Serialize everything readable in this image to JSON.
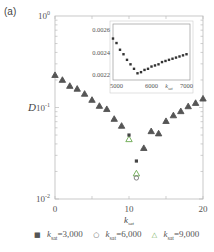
{
  "panel_label": "(a)",
  "chart_data": [
    {
      "type": "scatter",
      "title": "",
      "xlabel": "k_sat",
      "ylabel": "D",
      "xscale": "linear",
      "yscale": "log",
      "xlim": [
        0,
        20
      ],
      "ylim": [
        0.01,
        1
      ],
      "xticks": [
        0,
        10,
        20
      ],
      "xtick_labels": [
        "0",
        "10",
        "20"
      ],
      "yticks": [
        0.01,
        0.1,
        1
      ],
      "ytick_labels": [
        "10^-2",
        "10^-1",
        "10^0"
      ],
      "grid": false,
      "legend_position": "bottom",
      "series": [
        {
          "name": "k_sat=3,000",
          "marker": "square",
          "color": "#555555",
          "x": [
            0,
            1,
            2,
            3,
            4,
            5,
            6,
            7,
            8,
            9,
            10,
            11,
            12,
            13,
            14,
            15,
            16,
            17,
            18,
            19,
            20
          ],
          "y": [
            0.226,
            0.2,
            0.172,
            0.16,
            0.141,
            0.121,
            0.104,
            0.096,
            0.075,
            0.063,
            0.05,
            0.026,
            0.044,
            0.055,
            0.052,
            0.071,
            0.082,
            0.091,
            0.103,
            0.112,
            0.125
          ]
        },
        {
          "name": "k_sat=6,000",
          "marker": "circle-open",
          "color": "#555555",
          "x": [
            0,
            1,
            2,
            3,
            4,
            5,
            6,
            7,
            8,
            9,
            10,
            11,
            12,
            13,
            14,
            15,
            16,
            17,
            18,
            19,
            20
          ],
          "y": [
            0.226,
            0.2,
            0.172,
            0.16,
            0.141,
            0.121,
            0.104,
            0.096,
            0.075,
            0.063,
            0.045,
            0.017,
            0.036,
            0.055,
            0.052,
            0.071,
            0.082,
            0.091,
            0.103,
            0.112,
            0.125
          ]
        },
        {
          "name": "k_sat=9,000",
          "marker": "triangle-open",
          "color": "#6aa84f",
          "x": [
            0,
            1,
            2,
            3,
            4,
            5,
            6,
            7,
            8,
            9,
            10,
            11,
            12,
            13,
            14,
            15,
            16,
            17,
            18,
            19,
            20
          ],
          "y": [
            0.226,
            0.2,
            0.172,
            0.16,
            0.141,
            0.121,
            0.104,
            0.096,
            0.075,
            0.063,
            0.045,
            0.019,
            0.036,
            0.055,
            0.052,
            0.071,
            0.082,
            0.091,
            0.103,
            0.112,
            0.125
          ]
        }
      ]
    },
    {
      "type": "scatter",
      "title": "inset",
      "xlabel": "k_sat",
      "ylabel": "",
      "xlim": [
        4900,
        7100
      ],
      "ylim": [
        0.00215,
        0.00265
      ],
      "xticks": [
        5000,
        6000,
        7000
      ],
      "xtick_labels": [
        "5000",
        "6000",
        "7000"
      ],
      "yticks": [
        0.0022,
        0.0024,
        0.0026
      ],
      "ytick_labels": [
        "0.0022",
        "0.0024",
        "0.0026"
      ],
      "series": [
        {
          "name": "D",
          "marker": "square",
          "color": "#333333",
          "x": [
            4900,
            5000,
            5100,
            5200,
            5300,
            5400,
            5500,
            5600,
            5700,
            5800,
            5900,
            6000,
            6100,
            6200,
            6300,
            6400,
            6500,
            6600,
            6700,
            6800,
            6900,
            7000
          ],
          "y": [
            0.00252,
            0.00248,
            0.00242,
            0.00238,
            0.00233,
            0.00229,
            0.00225,
            0.00221,
            0.00222,
            0.00224,
            0.00225,
            0.00227,
            0.00228,
            0.00229,
            0.00231,
            0.00232,
            0.00233,
            0.00234,
            0.00235,
            0.00236,
            0.00237,
            0.00238
          ]
        }
      ]
    }
  ],
  "legend": {
    "items": [
      {
        "symbol": "■",
        "label": "k",
        "sub": "sat",
        "value": "=3,000",
        "color": "#555555"
      },
      {
        "symbol": "○",
        "label": "k",
        "sub": "sat",
        "value": "=6,000",
        "color": "#555555"
      },
      {
        "symbol": "△",
        "label": "k",
        "sub": "sat",
        "value": "=9,000",
        "color": "#6aa84f"
      }
    ]
  }
}
